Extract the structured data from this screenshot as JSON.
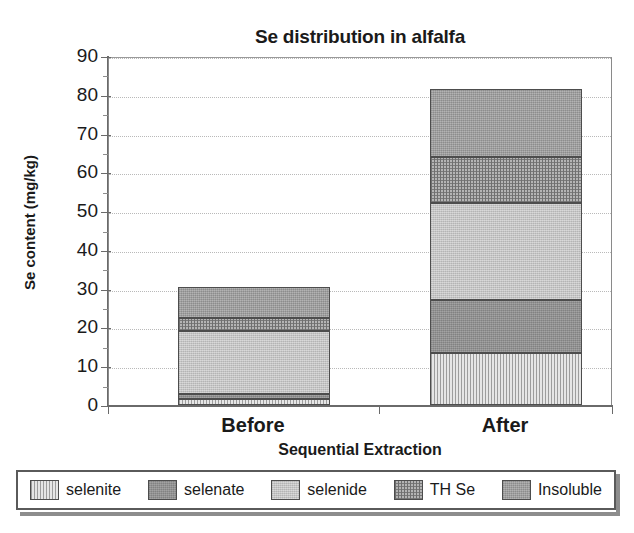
{
  "chart_data": {
    "type": "bar",
    "subtype": "stacked-bar",
    "title": "Se distribution in alfalfa",
    "subtitle": "Before and after mineralization",
    "xlabel": "Sequential Extraction",
    "ylabel": "Se content (mg/kg)",
    "categories": [
      "Before",
      "After"
    ],
    "ylim": [
      0,
      90
    ],
    "yticks": [
      0,
      10,
      20,
      30,
      40,
      50,
      60,
      70,
      80,
      90
    ],
    "ytick_labels": [
      "0",
      "10",
      "20",
      "30",
      "40",
      "50",
      "60",
      "70",
      "80",
      "90"
    ],
    "grid": true,
    "grid_axis": "y",
    "legend_position": "bottom",
    "stack_order_bottom_to_top": [
      "selenite",
      "selenate",
      "selenide",
      "TH Se",
      "Insoluble"
    ],
    "series": [
      {
        "name": "selenite",
        "values": [
          1.5,
          13.5
        ],
        "fill": "vertical-hatch-light",
        "color": "#dcdcdc"
      },
      {
        "name": "selenate",
        "values": [
          1.3,
          13.5
        ],
        "fill": "solid-dark-grey",
        "color": "#909090"
      },
      {
        "name": "selenide",
        "values": [
          16.2,
          25.0
        ],
        "fill": "solid-light-grey",
        "color": "#c6c6c6"
      },
      {
        "name": "TH Se",
        "values": [
          3.5,
          12.0
        ],
        "fill": "cross-hatch",
        "color": "#b4b4b4"
      },
      {
        "name": "Insoluble",
        "values": [
          8.0,
          17.5
        ],
        "fill": "solid-mid-grey",
        "color": "#9e9e9e"
      }
    ],
    "totals": [
      30.5,
      81.5
    ]
  },
  "legend": {
    "items": [
      {
        "label": "selenite"
      },
      {
        "label": "selenate"
      },
      {
        "label": "selenide"
      },
      {
        "label": "TH Se"
      },
      {
        "label": "Insoluble"
      }
    ]
  }
}
